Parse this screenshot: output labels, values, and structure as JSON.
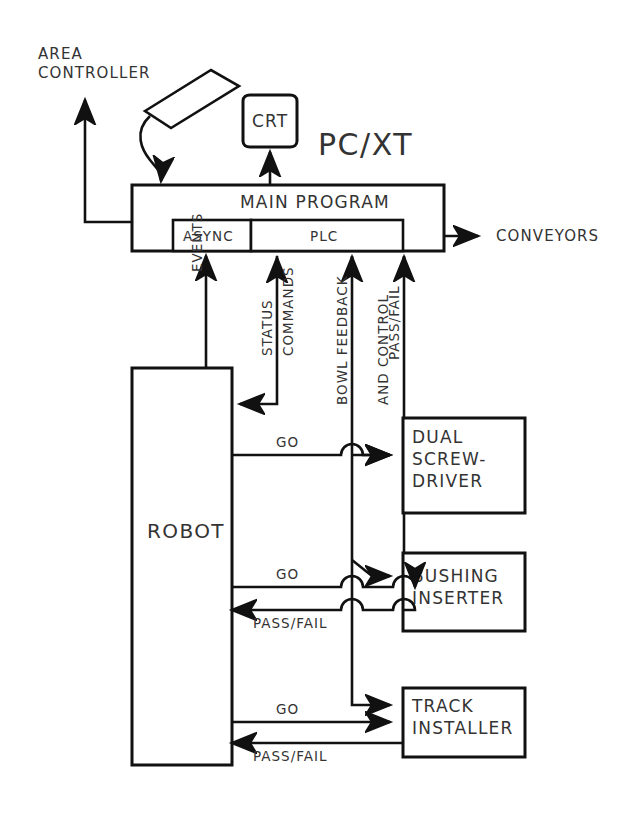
{
  "diagram": {
    "type": "block-diagram",
    "background_color": "#ffffff",
    "line_color": "#111111",
    "text_color": "#333333"
  },
  "external": {
    "area_controller_line1": "AREA",
    "area_controller_line2": "CONTROLLER",
    "conveyors": "CONVEYORS"
  },
  "computer": {
    "system_label": "PC/XT",
    "crt_label": "CRT",
    "main_program_label": "MAIN PROGRAM",
    "async_label": "ASYNC",
    "plc_label": "PLC",
    "keyboard_name": "keyboard"
  },
  "signals": {
    "events": "EVENTS",
    "status": "STATUS",
    "commands": "COMMANDS",
    "bowl_feedback": "BOWL  FEEDBACK",
    "and_control": "AND  CONTROL",
    "pass_fail_bus": "PASS/FAIL",
    "go_1": "GO",
    "go_2": "GO",
    "go_3": "GO",
    "pass_fail_1": "PASS/FAIL",
    "pass_fail_2": "PASS/FAIL"
  },
  "nodes": {
    "robot": "ROBOT",
    "screwdriver_line1": "DUAL",
    "screwdriver_line2": "SCREW-",
    "screwdriver_line3": "DRIVER",
    "bushing_line1": "BUSHING",
    "bushing_line2": "INSERTER",
    "track_line1": "TRACK",
    "track_line2": "INSTALLER"
  }
}
